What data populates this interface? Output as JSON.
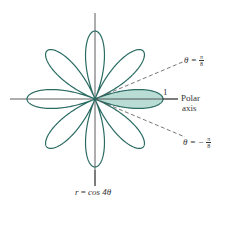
{
  "figure": {
    "equation": "r = cos 4θ",
    "equation_parts": {
      "lhs": "r",
      "eq": "=",
      "rhs": "cos 4θ"
    },
    "polar_axis_label_line1": "Polar",
    "polar_axis_label_line2": "axis",
    "radius_tick_label": "1",
    "ray_upper": {
      "lhs": "θ =",
      "num": "π",
      "den": "8"
    },
    "ray_lower": {
      "lhs": "θ = −",
      "num": "π",
      "den": "8"
    },
    "colors": {
      "curve": "#2a6b63",
      "shaded_fill": "#b9dcd5",
      "axes": "#333333",
      "dashed_rays": "#555555"
    },
    "curve": {
      "type": "rose",
      "function": "cos",
      "n": 4,
      "petals": 8,
      "shaded_petal": "between θ=-π/8 and θ=π/8"
    }
  }
}
